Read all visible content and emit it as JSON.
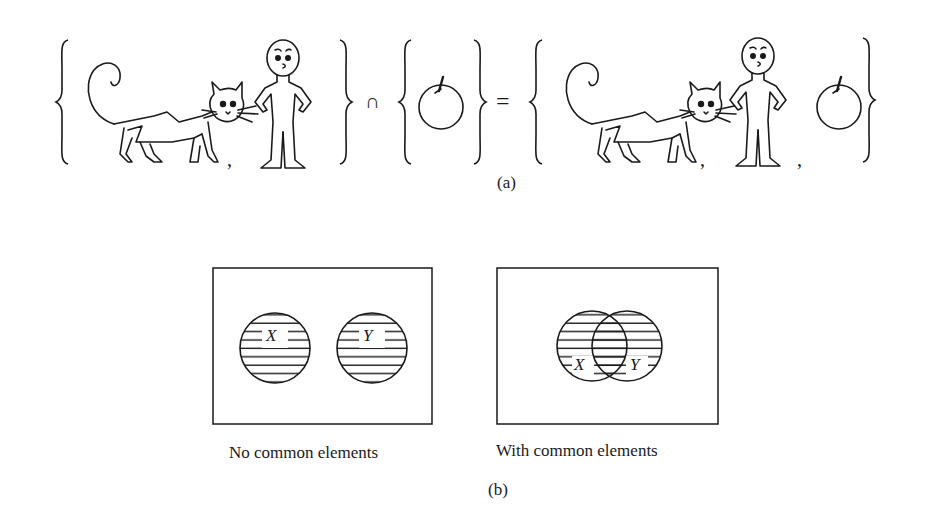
{
  "part_a": {
    "caption": "(a)",
    "equation": {
      "left_set": [
        "cat",
        "boy"
      ],
      "operator": "∩",
      "right_set": [
        "apple"
      ],
      "equals": "=",
      "result_set": [
        "cat",
        "boy",
        "apple"
      ]
    },
    "separator": ","
  },
  "part_b": {
    "caption": "(b)",
    "diagrams": [
      {
        "title": "No common elements",
        "sets": [
          "X",
          "Y"
        ],
        "overlap": false
      },
      {
        "title": "With common elements",
        "sets": [
          "X",
          "Y"
        ],
        "overlap": true
      }
    ]
  },
  "colors": {
    "ink": "#1a1a1a",
    "background": "#ffffff"
  }
}
